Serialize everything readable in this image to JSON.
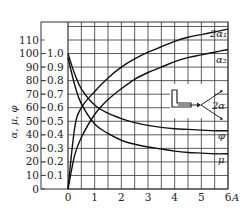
{
  "chart_data": {
    "type": "line",
    "title": "",
    "xlabel": "A",
    "ylabel": "α, μ, φ",
    "xlim": [
      0,
      6
    ],
    "ylim_left": [
      0,
      110
    ],
    "ylim_right": [
      0,
      1.0
    ],
    "grid": true,
    "x_ticks": [
      "0",
      "1",
      "2",
      "3",
      "4",
      "5",
      "6"
    ],
    "y_ticks_left": [
      "0",
      "10",
      "20",
      "30",
      "40",
      "50",
      "60",
      "70",
      "80",
      "90",
      "100",
      "110"
    ],
    "y_ticks_right": [
      "0.1",
      "0.2",
      "0.3",
      "0.4",
      "0.5",
      "0.6",
      "0.7",
      "0.8",
      "0.9",
      "1.0"
    ],
    "x": [
      0,
      0.25,
      0.5,
      1,
      1.5,
      2,
      2.5,
      3,
      3.5,
      4,
      4.5,
      5,
      5.5,
      6
    ],
    "series": [
      {
        "name": "2α1",
        "axis": "left",
        "values": [
          0,
          45,
          60,
          72,
          82,
          90,
          96,
          101,
          105,
          109,
          112,
          114,
          116,
          118
        ]
      },
      {
        "name": "α2",
        "axis": "left",
        "values": [
          0,
          25,
          38,
          55,
          66,
          74,
          81,
          86,
          90,
          94,
          97,
          99,
          101,
          103
        ]
      },
      {
        "name": "φ",
        "axis": "right",
        "values": [
          1.0,
          0.85,
          0.74,
          0.62,
          0.56,
          0.52,
          0.49,
          0.47,
          0.455,
          0.445,
          0.44,
          0.435,
          0.43,
          0.43
        ]
      },
      {
        "name": "μ",
        "axis": "right",
        "values": [
          0.97,
          0.77,
          0.63,
          0.48,
          0.41,
          0.36,
          0.33,
          0.31,
          0.295,
          0.28,
          0.27,
          0.265,
          0.26,
          0.26
        ]
      }
    ],
    "annotations": [
      "2α1",
      "α2",
      "φ",
      "μ",
      "2α"
    ],
    "legend_position": "inline-right",
    "inset": "nozzle sketch with spray angle 2α"
  },
  "labels": {
    "y_axis": "α, μ, φ",
    "x_axis": "A",
    "curve_2a1": "2α₁",
    "curve_a2": "α₂",
    "curve_phi": "φ",
    "curve_mu": "μ",
    "inset_angle": "2α"
  }
}
